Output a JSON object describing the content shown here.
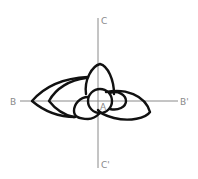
{
  "diagram": {
    "labels": {
      "top": "C",
      "bottom": "C'",
      "left": "B",
      "right": "B'",
      "center": "A"
    },
    "colors": {
      "axis": "#8a8a8a",
      "outline": "#111111",
      "background": "#ffffff"
    }
  }
}
